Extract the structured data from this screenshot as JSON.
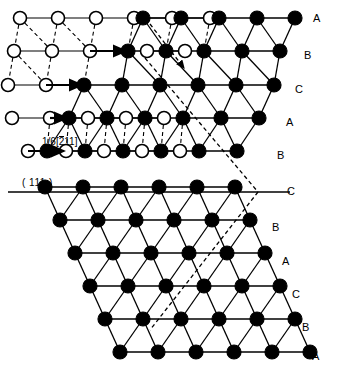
{
  "figure": {
    "type": "crystal-lattice-diagram",
    "width": 337,
    "height": 365,
    "colors": {
      "line": "#000000",
      "atom_fill_filled": "#000000",
      "atom_fill_open": "#ffffff",
      "background": "#ffffff"
    }
  },
  "labels": {
    "burgers_vector": {
      "fraction": "1/6",
      "bracket_open": "[",
      "index_1": "2",
      "index_1_bar": true,
      "index_2": "1",
      "index_3": "1",
      "bracket_close": "]",
      "full_text": "1/6[211]"
    },
    "slip_plane": "( 111 )"
  },
  "row_labels": [
    {
      "text": "A",
      "x": 313,
      "y": 13
    },
    {
      "text": "B",
      "x": 304,
      "y": 50
    },
    {
      "text": "C",
      "x": 295,
      "y": 84
    },
    {
      "text": "A",
      "x": 286,
      "y": 117
    },
    {
      "text": "B",
      "x": 277,
      "y": 150
    },
    {
      "text": "C",
      "x": 287,
      "y": 186
    },
    {
      "text": "B",
      "x": 272,
      "y": 222
    },
    {
      "text": "A",
      "x": 282,
      "y": 256
    },
    {
      "text": "C",
      "x": 292,
      "y": 289
    },
    {
      "text": "B",
      "x": 302,
      "y": 322
    },
    {
      "text": "A",
      "x": 312,
      "y": 351
    }
  ],
  "lattice": {
    "row_count": 11,
    "column_spacing": 38,
    "row_spacing": 33.4,
    "shear_per_row": -9,
    "atom_radius_filled": 7,
    "atom_radius_open": 6.5,
    "stacking_sequence": [
      "A",
      "B",
      "C",
      "A",
      "B",
      "C",
      "B",
      "A",
      "C",
      "B",
      "A"
    ],
    "rows": [
      {
        "index": 0,
        "label": "A",
        "y": 18,
        "x0": 20,
        "open": [
          20,
          58,
          96,
          134
        ],
        "filled": [
          143,
          181,
          219,
          257,
          295
        ],
        "open_shift": [
          172,
          210
        ],
        "filled_under": []
      },
      {
        "index": 1,
        "label": "B",
        "y": 51,
        "x0": 14,
        "open": [
          14,
          52,
          90
        ],
        "filled": [
          128,
          166,
          204,
          242,
          280
        ],
        "open_shift": [
          147,
          185
        ],
        "filled_under": []
      },
      {
        "index": 2,
        "label": "C",
        "y": 85,
        "x0": 8,
        "open": [
          8,
          46
        ],
        "filled": [
          84,
          122,
          160,
          198,
          236,
          274
        ],
        "open_shift": [],
        "filled_under": []
      },
      {
        "index": 3,
        "label": "A",
        "y": 118,
        "x0": 12,
        "open": [
          12,
          50
        ],
        "filled": [
          69,
          107,
          145,
          183,
          221,
          259
        ],
        "open_shift": [
          88,
          126,
          164
        ],
        "filled_under": []
      },
      {
        "index": 4,
        "label": "B",
        "y": 151,
        "x0": 28,
        "open": [
          28
        ],
        "filled": [
          47,
          85,
          123,
          161,
          199,
          237
        ],
        "open_shift": [
          66,
          104,
          142,
          180
        ],
        "filled_under": []
      },
      {
        "index": 5,
        "label": "C",
        "y": 187,
        "x0": 45,
        "open": [],
        "filled": [
          45,
          83,
          121,
          159,
          197,
          235
        ],
        "open_shift": [],
        "filled_under": []
      },
      {
        "index": 6,
        "label": "B",
        "y": 220,
        "x0": 60,
        "open": [],
        "filled": [
          60,
          98,
          136,
          174,
          212,
          250
        ],
        "open_shift": [],
        "filled_under": []
      },
      {
        "index": 7,
        "label": "A",
        "y": 253,
        "x0": 75,
        "open": [],
        "filled": [
          75,
          113,
          151,
          189,
          227,
          265
        ],
        "open_shift": [],
        "filled_under": []
      },
      {
        "index": 8,
        "label": "C",
        "y": 286,
        "x0": 90,
        "open": [],
        "filled": [
          90,
          128,
          166,
          204,
          242,
          280
        ],
        "open_shift": [],
        "filled_under": []
      },
      {
        "index": 9,
        "label": "B",
        "y": 319,
        "x0": 105,
        "open": [],
        "filled": [
          105,
          143,
          181,
          219,
          257,
          295
        ],
        "open_shift": [],
        "filled_under": []
      },
      {
        "index": 10,
        "label": "A",
        "y": 352,
        "x0": 120,
        "open": [],
        "filled": [
          120,
          158,
          196,
          234,
          272,
          310
        ],
        "open_shift": [],
        "filled_under": []
      }
    ]
  },
  "slip_plane_line": {
    "x1": 8,
    "y1": 192,
    "x2": 290,
    "y2": 192
  },
  "glide_arrows": [
    {
      "x1": 90,
      "y1": 51,
      "x2": 126,
      "y2": 51
    },
    {
      "x1": 46,
      "y1": 85,
      "x2": 82,
      "y2": 85
    },
    {
      "x1": 50,
      "y1": 118,
      "x2": 67,
      "y2": 118
    },
    {
      "x1": 28,
      "y1": 151,
      "x2": 64,
      "y2": 151
    }
  ],
  "dashed_arrow": {
    "x1": 150,
    "y1": 24,
    "x2": 184,
    "y2": 68
  }
}
